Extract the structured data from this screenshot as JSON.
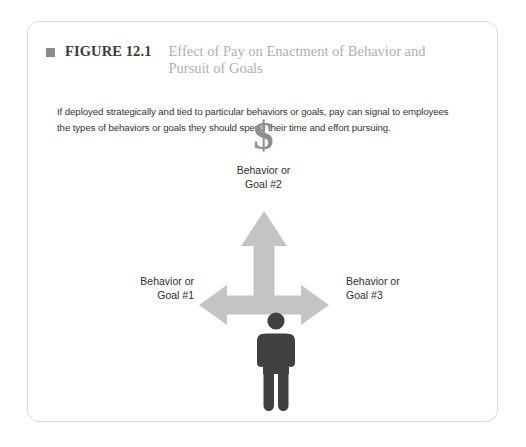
{
  "figure": {
    "bullet_icon": "square-bullet-icon",
    "label": "FIGURE 12.1",
    "title": "Effect of Pay on Enactment of Behavior and Pursuit of Goals",
    "caption": "If deployed strategically and tied to particular behaviors or goals, pay can signal to employees the types of behaviors or goals they should spend their time and effort pursuing."
  },
  "diagram": {
    "money_icon": "$",
    "person_icon": "person-pictogram-icon",
    "nodes": [
      {
        "id": "top",
        "label": "Behavior or\nGoal #2"
      },
      {
        "id": "left",
        "label": "Behavior or\nGoal #1"
      },
      {
        "id": "right",
        "label": "Behavior or\nGoal #3"
      }
    ],
    "labels": {
      "top_line1": "Behavior or",
      "top_line2": "Goal #2",
      "left_line1": "Behavior or",
      "left_line2": "Goal #1",
      "right_line1": "Behavior or",
      "right_line2": "Goal #3"
    },
    "arrows": [
      {
        "id": "up-arrow",
        "direction": "up"
      },
      {
        "id": "horizontal-double-arrow",
        "direction": "left-right"
      }
    ],
    "colors": {
      "arrow": "#c4c4c4",
      "person": "#404040",
      "money": "#8f8f8f",
      "label_text": "#2e2e2e",
      "title_text": "#b0b0b0",
      "figure_label_text": "#3c3c3c",
      "card_border": "#d8d8d8",
      "background": "#ffffff"
    }
  }
}
